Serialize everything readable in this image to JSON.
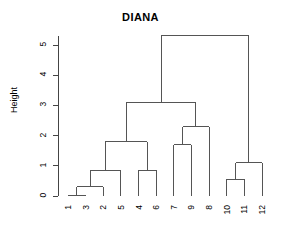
{
  "chart_data": {
    "type": "dendrogram",
    "title": "DIANA",
    "xlabel": "",
    "ylabel": "Height",
    "ylim": [
      0,
      5.6
    ],
    "yticks": [
      0,
      1,
      2,
      3,
      4,
      5
    ],
    "ytick_labels": [
      "0",
      "1",
      "2",
      "3",
      "4",
      "5"
    ],
    "grid": false,
    "legend": null,
    "leaf_order": [
      "1",
      "3",
      "2",
      "5",
      "4",
      "6",
      "7",
      "9",
      "8",
      "10",
      "11",
      "12"
    ],
    "leaf_heights": [
      0,
      0,
      0,
      0,
      0,
      0,
      0,
      0,
      0,
      0,
      0,
      0
    ],
    "merges": [
      {
        "id": "m1",
        "children": [
          "1",
          "3"
        ],
        "height": 0.02
      },
      {
        "id": "m2",
        "children": [
          "m1",
          "2"
        ],
        "height": 0.3
      },
      {
        "id": "m3",
        "children": [
          "m2",
          "5"
        ],
        "height": 0.85
      },
      {
        "id": "m4",
        "children": [
          "4",
          "6"
        ],
        "height": 0.85
      },
      {
        "id": "m5",
        "children": [
          "m3",
          "m4"
        ],
        "height": 1.8
      },
      {
        "id": "m6",
        "children": [
          "7",
          "9"
        ],
        "height": 1.7
      },
      {
        "id": "m7",
        "children": [
          "m6",
          "8"
        ],
        "height": 2.3
      },
      {
        "id": "m8",
        "children": [
          "m5",
          "m7"
        ],
        "height": 3.1
      },
      {
        "id": "m9",
        "children": [
          "10",
          "11"
        ],
        "height": 0.55
      },
      {
        "id": "m10",
        "children": [
          "m9",
          "12"
        ],
        "height": 1.1
      },
      {
        "id": "m11",
        "children": [
          "m8",
          "m10"
        ],
        "height": 5.3
      }
    ],
    "line_color": "#555555",
    "axis_color": "#444444",
    "text_color": "#000000"
  },
  "plot": {
    "title": "DIANA",
    "y_axis_title": "Height"
  }
}
